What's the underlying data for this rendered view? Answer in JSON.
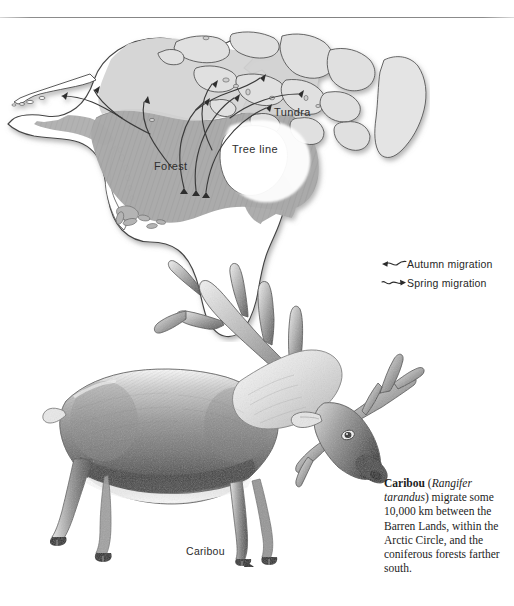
{
  "figure": {
    "title_label": "Caribou",
    "map": {
      "labels": {
        "forest": "Forest",
        "tundra": "Tundra",
        "tree_line": "Tree line"
      },
      "colors": {
        "forest_fill": "#a9a9a9",
        "tundra_fill": "#d2d2d2",
        "land_outline": "#4a4a4a",
        "ocean": "#ffffff",
        "lake_fill": "#b0b0b0"
      }
    },
    "legend": {
      "items": [
        {
          "icon": "arrow-left-wavy-icon",
          "label": "Autumn migration",
          "direction": "left"
        },
        {
          "icon": "arrow-right-wavy-icon",
          "label": "Spring migration",
          "direction": "right"
        }
      ]
    },
    "illustration": {
      "subject_label": "Caribou",
      "style": "engraving"
    },
    "caption": {
      "species_common": "Caribou",
      "species_latin": "Rangifer tarandus",
      "text_before_latin": "Caribou",
      "text_after_latin": ") migrate some 10,000 km between the Barren Lands, within the Arctic Circle, and the coniferous forests farther south.",
      "distance": "10,000 km",
      "region_1": "Barren Lands",
      "region_2": "Arctic Circle",
      "region_3": "coniferous forests",
      "full_text": "Caribou (Rangifer tarandus) migrate some 10,000 km between the Barren Lands, within the Arctic Circle, and the coniferous forests farther south."
    }
  }
}
